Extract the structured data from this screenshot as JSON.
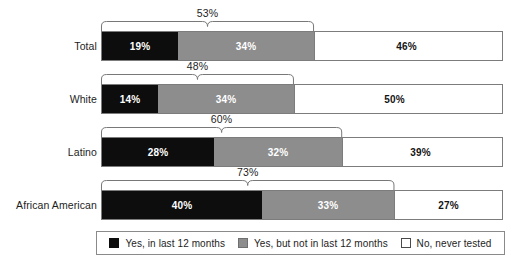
{
  "chart_data": {
    "type": "bar",
    "title": "",
    "subtitle": "",
    "xlabel": "",
    "ylabel": "",
    "orientation": "horizontal",
    "stacked": true,
    "xlim": [
      0,
      100
    ],
    "grid": false,
    "legend_position": "bottom",
    "categories": [
      "Total",
      "White",
      "Latino",
      "African American"
    ],
    "series": [
      {
        "name": "Yes, in last 12 months",
        "color": "#0d0d0d",
        "values": [
          19,
          14,
          28,
          40
        ],
        "labels": [
          "19%",
          "14%",
          "28%",
          "40%"
        ]
      },
      {
        "name": "Yes, but not in last 12 months",
        "color": "#8d8d8d",
        "values": [
          34,
          34,
          32,
          33
        ],
        "labels": [
          "34%",
          "34%",
          "32%",
          "33%"
        ]
      },
      {
        "name": "No, never tested",
        "color": "#ffffff",
        "values": [
          46,
          50,
          39,
          27
        ],
        "labels": [
          "46%",
          "50%",
          "39%",
          "27%"
        ]
      }
    ],
    "annotations": [
      {
        "category": "Total",
        "type": "brace",
        "span": [
          0,
          53
        ],
        "label": "53%"
      },
      {
        "category": "White",
        "type": "brace",
        "span": [
          0,
          48
        ],
        "label": "48%"
      },
      {
        "category": "Latino",
        "type": "brace",
        "span": [
          0,
          60
        ],
        "label": "60%"
      },
      {
        "category": "African American",
        "type": "brace",
        "span": [
          0,
          73
        ],
        "label": "73%"
      }
    ]
  },
  "rows": [
    {
      "label": "Total",
      "brace_label": "53%",
      "brace_pct": 53,
      "segments": [
        {
          "label": "19%",
          "pct": 19,
          "style": "black"
        },
        {
          "label": "34%",
          "pct": 34,
          "style": "gray"
        },
        {
          "label": "46%",
          "pct": 46,
          "style": "white"
        }
      ]
    },
    {
      "label": "White",
      "brace_label": "48%",
      "brace_pct": 48,
      "segments": [
        {
          "label": "14%",
          "pct": 14,
          "style": "black"
        },
        {
          "label": "34%",
          "pct": 34,
          "style": "gray"
        },
        {
          "label": "50%",
          "pct": 50,
          "style": "white"
        }
      ]
    },
    {
      "label": "Latino",
      "brace_label": "60%",
      "brace_pct": 60,
      "segments": [
        {
          "label": "28%",
          "pct": 28,
          "style": "black"
        },
        {
          "label": "32%",
          "pct": 32,
          "style": "gray"
        },
        {
          "label": "39%",
          "pct": 39,
          "style": "white"
        }
      ]
    },
    {
      "label": "African American",
      "brace_label": "73%",
      "brace_pct": 73,
      "segments": [
        {
          "label": "40%",
          "pct": 40,
          "style": "black"
        },
        {
          "label": "33%",
          "pct": 33,
          "style": "gray"
        },
        {
          "label": "27%",
          "pct": 27,
          "style": "white"
        }
      ]
    }
  ],
  "legend": {
    "items": [
      {
        "label": "Yes, in last 12 months",
        "style": "black",
        "color": "#0d0d0d"
      },
      {
        "label": "Yes, but not in last 12 months",
        "style": "gray",
        "color": "#8d8d8d"
      },
      {
        "label": "No, never tested",
        "style": "white",
        "color": "#ffffff"
      }
    ]
  }
}
